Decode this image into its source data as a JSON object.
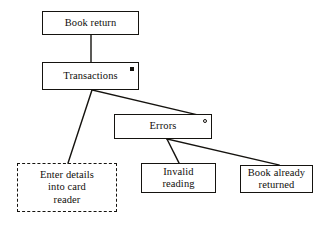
{
  "figure": {
    "kind": "structure-decomposition-diagram",
    "background_color": "#ffffff",
    "line_color": "#15130f",
    "text_color": "#100e0b"
  },
  "nodes": {
    "book_return": {
      "label": "Book return",
      "border_style": "solid",
      "marker": "none"
    },
    "transactions": {
      "label": "Transactions",
      "border_style": "solid",
      "marker": "filled-square",
      "marker_name": "iteration-marker"
    },
    "errors": {
      "label": "Errors",
      "border_style": "solid",
      "marker": "hollow-circle",
      "marker_name": "selection-marker"
    },
    "enter_details": {
      "label": "Enter details\ninto card\nreader",
      "border_style": "dashed",
      "marker": "none"
    },
    "invalid_reading": {
      "label": "Invalid\nreading",
      "border_style": "solid",
      "marker": "none"
    },
    "book_already_returned": {
      "label": "Book already\nreturned",
      "border_style": "solid",
      "marker": "none"
    }
  },
  "connectors": [
    {
      "name": "book-return-to-transactions",
      "from": "book_return",
      "to": "transactions"
    },
    {
      "name": "transactions-to-enter-details",
      "from": "transactions",
      "to": "enter_details"
    },
    {
      "name": "transactions-to-errors",
      "from": "transactions",
      "to": "errors"
    },
    {
      "name": "errors-to-invalid-reading",
      "from": "errors",
      "to": "invalid_reading"
    },
    {
      "name": "errors-to-book-already-returned",
      "from": "errors",
      "to": "book_already_returned"
    }
  ]
}
